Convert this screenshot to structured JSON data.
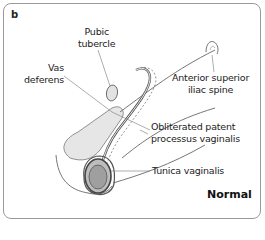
{
  "figure": {
    "panel_letter": "b",
    "condition": "Normal"
  },
  "labels": {
    "pubic_tubercle": [
      "Pubic",
      "tubercle"
    ],
    "vas_deferens": [
      "Vas",
      "deferens"
    ],
    "asis": [
      "Anterior superior",
      "iliac spine"
    ],
    "obliterated_pv": [
      "Obliterated patent",
      "processus vaginalis"
    ],
    "tunica_vaginalis": "Tunica vaginalis"
  },
  "colors": {
    "outline": "#555555",
    "fill_gray": "#d9d9d9",
    "testis_fill": "#a8a8a8",
    "border": "#9a9a9a"
  }
}
